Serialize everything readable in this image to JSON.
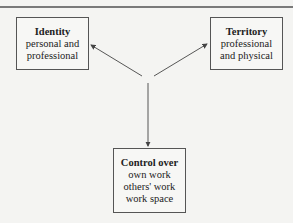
{
  "diagram": {
    "nodes": [
      {
        "id": "identity",
        "title": "Identity",
        "lines": [
          "personal and",
          "professional"
        ]
      },
      {
        "id": "territory",
        "title": "Territory",
        "lines": [
          "professional",
          "and physical"
        ]
      },
      {
        "id": "control",
        "title": "Control over",
        "lines": [
          "own work",
          "others' work",
          "work space"
        ]
      }
    ],
    "edges": [
      {
        "from": "center",
        "to": "identity"
      },
      {
        "from": "center",
        "to": "territory"
      },
      {
        "from": "center",
        "to": "control"
      }
    ],
    "colors": {
      "background": "#f4f4f2",
      "line": "#444444",
      "text": "#222222"
    }
  }
}
